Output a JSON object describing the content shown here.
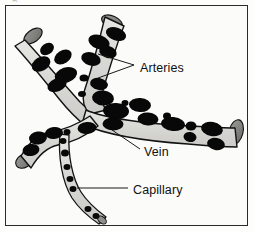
{
  "figure": {
    "kind": "anatomical-diagram",
    "page_bleed_text": "g",
    "frame": {
      "border_color": "#2a2a2a",
      "background": "#fbfbfa"
    },
    "palette": {
      "page_background": "#fdfdfc",
      "vessel_fill": "#d6d6d2",
      "vessel_fill_light": "#e4e4e0",
      "vessel_outline": "#121212",
      "cut_end_cap": "#8a8a86",
      "cut_end_cap_dark": "#6e6e6a",
      "blood_cell": "#0a0a0a",
      "leader_line": "#1a1a1a",
      "label_text": "#111111"
    },
    "labels": [
      {
        "id": "arteries",
        "text": "Arteries",
        "x": 134,
        "y": 63,
        "leader_style": "fork",
        "leader_points": "92,48 128,59 92,72"
      },
      {
        "id": "vein",
        "text": "Vein",
        "x": 138,
        "y": 147,
        "leader_style": "line",
        "leader_points": "106,124 134,143"
      },
      {
        "id": "capillary",
        "text": "Capillary",
        "x": 127,
        "y": 185,
        "leader_style": "line",
        "leader_points": "71,182 122,182"
      }
    ],
    "vessels": [
      {
        "id": "artery-upper-left",
        "name": "Artery (upper left limb)",
        "type": "artery"
      },
      {
        "id": "artery-upper-right",
        "name": "Artery (upper right limb)",
        "type": "artery"
      },
      {
        "id": "vein-main",
        "name": "Vein (main trunk to right)",
        "type": "vein"
      },
      {
        "id": "vein-branch-left",
        "name": "Vein (left branch)",
        "type": "vein"
      },
      {
        "id": "capillary-lower",
        "name": "Capillary (lower branch)",
        "type": "capillary"
      }
    ],
    "cut_ends": [
      {
        "id": "cut-end-artery-left",
        "cx": 27,
        "cy": 30,
        "rx": 10,
        "ry": 5.5,
        "rot": -36
      },
      {
        "id": "cut-end-artery-top",
        "cx": 104,
        "cy": 17,
        "rx": 10.5,
        "ry": 5.5,
        "rot": 22
      },
      {
        "id": "cut-end-vein-right",
        "cx": 229,
        "cy": 125,
        "rx": 6.5,
        "ry": 12,
        "rot": 16
      },
      {
        "id": "cut-end-vein-left",
        "cx": 19,
        "cy": 155,
        "rx": 8.5,
        "ry": 6,
        "rot": -30
      },
      {
        "id": "cut-end-capillary",
        "cx": 96,
        "cy": 215,
        "rx": 4.5,
        "ry": 3,
        "rot": 40
      }
    ],
    "blood_cells": [
      {
        "cx": 41,
        "cy": 43,
        "rx": 7.5,
        "ry": 5.5,
        "rot": -35
      },
      {
        "cx": 35,
        "cy": 57,
        "rx": 10,
        "ry": 7,
        "rot": -30
      },
      {
        "cx": 56,
        "cy": 50,
        "rx": 9.5,
        "ry": 6.5,
        "rot": -32
      },
      {
        "cx": 59,
        "cy": 68,
        "rx": 11.5,
        "ry": 7.5,
        "rot": -18
      },
      {
        "cx": 50,
        "cy": 78,
        "rx": 10,
        "ry": 6.5,
        "rot": -20
      },
      {
        "cx": 92,
        "cy": 36,
        "rx": 11,
        "ry": 7,
        "rot": 20
      },
      {
        "cx": 109,
        "cy": 29,
        "rx": 10.5,
        "ry": 6.5,
        "rot": 20
      },
      {
        "cx": 84,
        "cy": 52,
        "rx": 10,
        "ry": 6.5,
        "rot": 18
      },
      {
        "cx": 101,
        "cy": 46,
        "rx": 9,
        "ry": 6,
        "rot": 18
      },
      {
        "cx": 77,
        "cy": 71,
        "rx": 4.5,
        "ry": 3.5,
        "rot": 0
      },
      {
        "cx": 92,
        "cy": 78,
        "rx": 9,
        "ry": 6,
        "rot": 12
      },
      {
        "cx": 75,
        "cy": 87,
        "rx": 4,
        "ry": 3,
        "rot": 0
      },
      {
        "cx": 96,
        "cy": 92,
        "rx": 11,
        "ry": 7.5,
        "rot": 6
      },
      {
        "cx": 118,
        "cy": 97,
        "rx": 3.5,
        "ry": 3,
        "rot": 0
      },
      {
        "cx": 109,
        "cy": 104,
        "rx": 13,
        "ry": 8,
        "rot": 3
      },
      {
        "cx": 133,
        "cy": 98,
        "rx": 11,
        "ry": 7,
        "rot": 4
      },
      {
        "cx": 106,
        "cy": 117,
        "rx": 10.5,
        "ry": 6.5,
        "rot": 2
      },
      {
        "cx": 141,
        "cy": 112,
        "rx": 10.5,
        "ry": 6.5,
        "rot": 4
      },
      {
        "cx": 160,
        "cy": 110,
        "rx": 4,
        "ry": 3.5,
        "rot": 0
      },
      {
        "cx": 166,
        "cy": 117,
        "rx": 12,
        "ry": 7,
        "rot": 6
      },
      {
        "cx": 184,
        "cy": 119,
        "rx": 5.5,
        "ry": 4.5,
        "rot": 0
      },
      {
        "cx": 183,
        "cy": 130,
        "rx": 6.5,
        "ry": 5,
        "rot": 8
      },
      {
        "cx": 205,
        "cy": 122,
        "rx": 11,
        "ry": 7,
        "rot": 10
      },
      {
        "cx": 209,
        "cy": 137,
        "rx": 9,
        "ry": 6,
        "rot": 10
      },
      {
        "cx": 80,
        "cy": 122,
        "rx": 9.5,
        "ry": 6,
        "rot": -4
      },
      {
        "cx": 60,
        "cy": 126,
        "rx": 3.5,
        "ry": 3,
        "rot": 0
      },
      {
        "cx": 47,
        "cy": 127,
        "rx": 9,
        "ry": 6,
        "rot": -4
      },
      {
        "cx": 31,
        "cy": 131,
        "rx": 9,
        "ry": 6.5,
        "rot": -6
      },
      {
        "cx": 25,
        "cy": 143,
        "rx": 8.5,
        "ry": 6,
        "rot": -8
      },
      {
        "cx": 56,
        "cy": 134,
        "rx": 3.5,
        "ry": 3,
        "rot": 0
      },
      {
        "cx": 59,
        "cy": 146,
        "rx": 4,
        "ry": 3.5,
        "rot": 0
      },
      {
        "cx": 61,
        "cy": 160,
        "rx": 3.5,
        "ry": 3,
        "rot": 0
      },
      {
        "cx": 63,
        "cy": 172,
        "rx": 3.5,
        "ry": 3,
        "rot": 0
      },
      {
        "cx": 65,
        "cy": 182,
        "rx": 3.5,
        "ry": 3,
        "rot": 0
      },
      {
        "cx": 81,
        "cy": 203,
        "rx": 3.5,
        "ry": 3,
        "rot": 0
      },
      {
        "cx": 89,
        "cy": 210,
        "rx": 3.5,
        "ry": 3,
        "rot": 0
      }
    ]
  }
}
